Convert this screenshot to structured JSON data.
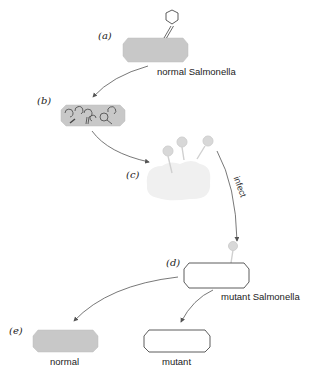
{
  "diagram": {
    "type": "phage transduction / mutant selection schematic",
    "steps": [
      {
        "id": "a",
        "label": "(a)",
        "caption": "normal Salmonella",
        "cell": "gray",
        "phages": "one attached phage"
      },
      {
        "id": "b",
        "label": "(b)",
        "caption": "",
        "cell": "gray",
        "phages": "phages replicating inside cell"
      },
      {
        "id": "c",
        "label": "(c)",
        "caption": "",
        "cell": "lysed (pale)",
        "phages": "three released phages"
      },
      {
        "id": "d",
        "label": "(d)",
        "caption": "mutant Salmonella",
        "cell": "white",
        "phages": "one attached pale phage"
      },
      {
        "id": "e",
        "label": "(e)",
        "outcomes": [
          {
            "caption": "normal",
            "cell": "gray"
          },
          {
            "caption": "mutant",
            "cell": "white"
          }
        ]
      }
    ],
    "arrow_labels": {
      "infect": "infect"
    },
    "colors": {
      "normal_cell": "#c8c8c8",
      "pale_cell": "#f0f0f0",
      "pale_phage": "#d8d8d8",
      "outline": "#333333",
      "arrow": "#555555"
    }
  }
}
